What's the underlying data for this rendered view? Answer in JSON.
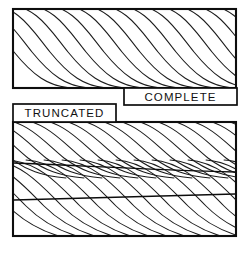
{
  "figure": {
    "width": 247,
    "height": 253,
    "background_color": "#ffffff",
    "line_color": "#1b1b1b",
    "frame_color": "#0d0d0d",
    "title": ""
  },
  "panels": [
    {
      "id": "complete",
      "label": "COMPLETE",
      "rect": {
        "x": 13,
        "y": 9,
        "width": 223,
        "height": 79
      },
      "label_box": {
        "x": 124,
        "y": 88,
        "width": 113,
        "height": 17
      },
      "label_align": "right",
      "divider_count": 0,
      "flow_line_count": 15
    },
    {
      "id": "truncated",
      "label": "TRUNCATED",
      "rect": {
        "x": 13,
        "y": 122,
        "width": 223,
        "height": 114
      },
      "label_box": {
        "x": 13,
        "y": 104,
        "width": 103,
        "height": 18
      },
      "label_align": "left",
      "divider_count": 2,
      "flow_line_count": 34
    }
  ],
  "dividers": [
    {
      "panel": "truncated",
      "x1": 13,
      "y1": 163,
      "x2": 236,
      "y2": 172
    },
    {
      "panel": "truncated",
      "x1": 13,
      "y1": 200,
      "x2": 236,
      "y2": 194
    }
  ],
  "caption": {
    "text": "",
    "visible": false
  },
  "colors": {
    "stroke": "#1b1b1b",
    "frame": "#0d0d0d",
    "fill": "#ffffff",
    "caption": "#c9c9c9"
  }
}
